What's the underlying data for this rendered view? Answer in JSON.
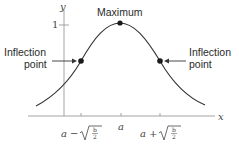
{
  "diagram": {
    "axes": {
      "x_label": "x",
      "y_label": "y",
      "y_tick_label": "1",
      "x_ticks": [
        {
          "label_prefix": "a −",
          "sqrt_num": "b",
          "sqrt_den": "2"
        },
        {
          "label": "a"
        },
        {
          "label_prefix": "a +",
          "sqrt_num": "b",
          "sqrt_den": "2"
        }
      ]
    },
    "annotations": {
      "maximum": "Maximum",
      "left_inflection": [
        "Inflection",
        "point"
      ],
      "right_inflection": [
        "Inflection",
        "point"
      ]
    },
    "colors": {
      "curve": "#333333",
      "axis": "#888888",
      "point": "#1a1a1a"
    }
  }
}
